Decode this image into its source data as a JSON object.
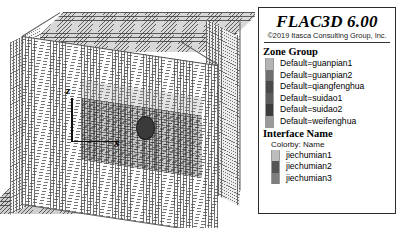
{
  "viewport": {
    "name": "flac3d-model-view",
    "axes": {
      "vertical": "z",
      "horizontal": "x"
    },
    "background": "#ffffff",
    "model_description": "3D wireframe zone mesh block with tunnel cross-section"
  },
  "legend": {
    "title": "FLAC3D 6.00",
    "copyright": "©2019 Itasca Consulting Group, Inc.",
    "sections": [
      {
        "heading": "Zone Group",
        "subtitle": null,
        "items": [
          {
            "label": "Default=guanpian1",
            "color": "#b4b4b4"
          },
          {
            "label": "Default=guanpian2",
            "color": "#6e6e6e"
          },
          {
            "label": "Default=qiangfenghua",
            "color": "#4a4a4a"
          },
          {
            "label": "Default=suidao1",
            "color": "#5c5c5c"
          },
          {
            "label": "Default=suidao2",
            "color": "#3c3c3c"
          },
          {
            "label": "Default=weifenghua",
            "color": "#9a9a9a"
          }
        ]
      },
      {
        "heading": "Interface Name",
        "subtitle": "Colorby: Name",
        "items": [
          {
            "label": "jiechumian1",
            "color": "#bdbdbd"
          },
          {
            "label": "jiechumian2",
            "color": "#555555"
          },
          {
            "label": "jiechumian3",
            "color": "#7d7d7d"
          }
        ]
      }
    ]
  }
}
